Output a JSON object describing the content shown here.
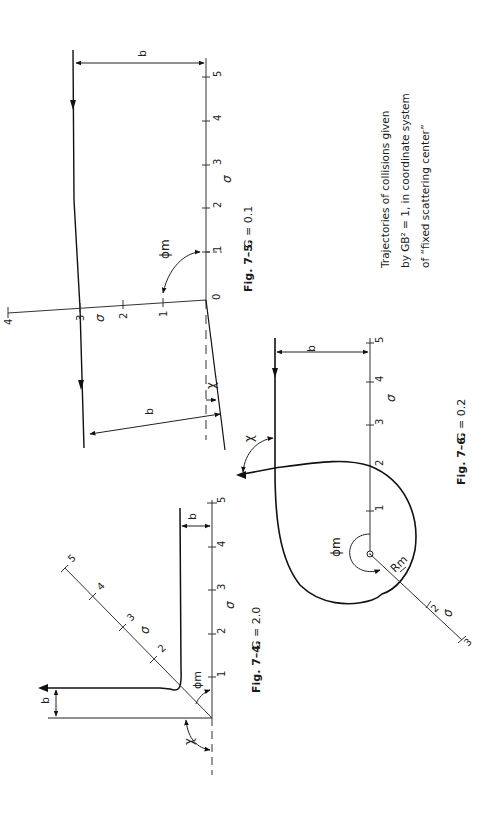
{
  "page": {
    "orientation": "rotated-90-ccw",
    "caption_block": {
      "lines": [
        "Trajectories of collisions given",
        "by GB² = 1, in coordinate system",
        "of “fixed scattering center”"
      ]
    }
  },
  "figures": [
    {
      "id": "fig-7-5",
      "caption_label": "Fig. 7–5.",
      "caption_eq": "G = 0.1",
      "axis_label": "σ",
      "axis_ticks": [
        "1",
        "2",
        "3",
        "4",
        "5"
      ],
      "origin_label": "0",
      "rotated_axis_ticks": [
        "1",
        "2",
        "3",
        "4"
      ],
      "rotated_axis_label": "σ",
      "labels": {
        "impact_top": "b",
        "impact_bottom": "b",
        "phi": "ϕm",
        "chi": "χ"
      }
    },
    {
      "id": "fig-7-4",
      "caption_label": "Fig. 7–4.",
      "caption_eq": "G = 2.0",
      "axis_label": "σ",
      "axis_ticks": [
        "1",
        "2",
        "3",
        "4",
        "5"
      ],
      "rotated_axis_ticks": [
        "2",
        "3",
        "4",
        "5"
      ],
      "rotated_axis_label": "σ",
      "labels": {
        "impact_top": "b",
        "impact_bottom": "b",
        "phi": "ϕm",
        "chi": "χ"
      }
    },
    {
      "id": "fig-7-6",
      "caption_label": "Fig. 7–6.",
      "caption_eq": "G = 0.2",
      "axis_label": "σ",
      "axis_ticks": [
        "1",
        "2",
        "3",
        "4",
        "5"
      ],
      "rotated_axis_ticks": [
        "2",
        "3"
      ],
      "rotated_axis_label": "σ",
      "labels": {
        "impact": "b",
        "phi": "ϕm",
        "r": "Rm",
        "chi": "χ"
      }
    }
  ]
}
